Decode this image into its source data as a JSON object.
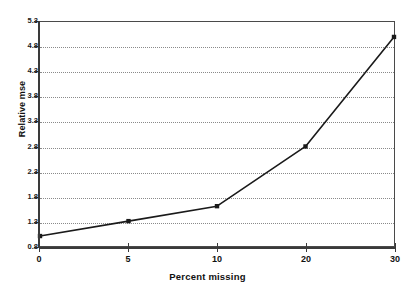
{
  "chart_data": {
    "type": "line",
    "title": "",
    "subtitle": "",
    "xlabel": "Percent missing",
    "ylabel": "Relative mse",
    "categories": [
      "0",
      "5",
      "10",
      "20",
      "30"
    ],
    "x": [
      0,
      5,
      10,
      20,
      30
    ],
    "values": [
      1.0,
      1.3,
      1.6,
      2.8,
      5.0
    ],
    "series": [
      {
        "name": "Relative mse",
        "values": [
          1.0,
          1.3,
          1.6,
          2.8,
          5.0
        ],
        "line_color": "#1a1a1a",
        "marker": "square",
        "marker_color": "#1a1a1a"
      }
    ],
    "ylim": [
      0.8,
      5.3
    ],
    "y_ticks": [
      0.8,
      1.3,
      1.8,
      2.3,
      2.8,
      3.3,
      3.8,
      4.3,
      4.8,
      5.3
    ],
    "y_tick_labels": [
      "0.8",
      "1.3",
      "1.8",
      "2.3",
      "2.8",
      "3.3",
      "3.8",
      "4.3",
      "4.8",
      "5.3"
    ],
    "x_tick_labels": [
      "0",
      "5",
      "10",
      "20",
      "30"
    ],
    "axis_type_x": "category",
    "grid": {
      "horizontal": true,
      "vertical": false,
      "style": "dotted",
      "color": "#8a8a8a"
    },
    "legend": {
      "visible": false,
      "position": "none",
      "entries": []
    },
    "annotations": [],
    "plot_border": true,
    "background_color": "#ffffff",
    "axis_color": "#3a3a3a"
  }
}
